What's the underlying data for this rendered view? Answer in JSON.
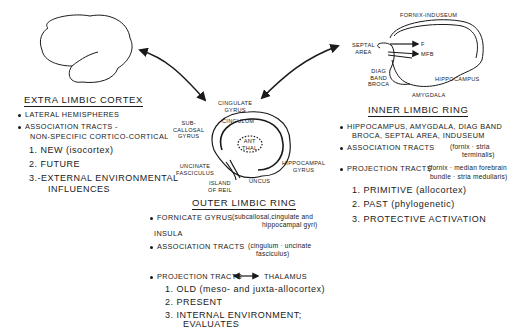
{
  "extra_limbic": {
    "heading": "EXTRA LIMBIC CORTEX",
    "bullets": [
      "LATERAL HEMISPHERES",
      "ASSOCIATION TRACTS -",
      "NON-SPECIFIC CORTICO-CORTICAL"
    ],
    "items": [
      "1. NEW (isocortex)",
      "2. FUTURE",
      "3.-EXTERNAL ENVIRONMENTAL",
      "INFLUENCES"
    ]
  },
  "center_labels": {
    "cingulate_gyrus": [
      "CINGULATE",
      "GYRUS"
    ],
    "subcallosal_gyrus": [
      "SUB-",
      "CALLOSAL",
      "GYRUS"
    ],
    "cingulum": "CINGULUM",
    "ant_thal": [
      "ANT",
      "THAL"
    ],
    "uncinate_fasciculus": [
      "UNCINATE",
      "FASCICULUS"
    ],
    "hippocampal_gyrus": [
      "HIPPOCAMPAL",
      "GYRUS"
    ],
    "island_of_reil": [
      "ISLAND",
      "OF REIL"
    ],
    "uncus": "UNCUS"
  },
  "outer_limbic": {
    "heading": "OUTER LIMBIC RING",
    "bullet1": "FORNICATE GYRUS",
    "bullet1_note": "(subcallosal,cingulate and",
    "bullet1_note2": "hippocampal gyri)",
    "insula": "INSULA",
    "bullet2": "ASSOCIATION TRACTS",
    "bullet2_note": "(cingulum · uncinate",
    "bullet2_note2": "fasciculus)",
    "bullet3": "PROJECTION TRACTS",
    "bullet3_target": "THALAMUS",
    "items": [
      "1. OLD (meso- and juxta-allocortex)",
      "2. PRESENT",
      "3. INTERNAL ENVIRONMENT;",
      "EVALUATES"
    ]
  },
  "inner_labels": {
    "fornix_induseum": "FORNIX-INDUSEUM",
    "septal_area": [
      "SEPTAL",
      "AREA"
    ],
    "f": "F",
    "mfb": "MFB",
    "diag_band_broca": [
      "DIAG",
      "BAND",
      "BROCA"
    ],
    "hippocampus": "HIPPOCAMPUS",
    "amygdala": "AMYGDALA"
  },
  "inner_limbic": {
    "heading": "INNER LIMBIC RING",
    "bullet1": "HIPPOCAMPUS, AMYGDALA, DIAG BAND",
    "bullet1b": "BROCA, SEPTAL AREA, INDUSEUM",
    "bullet2": "ASSOCIATION TRACTS",
    "bullet2_note": "(fornix · stria",
    "bullet2_note2": "terminalis)",
    "bullet3": "PROJECTION TRACTS",
    "bullet3_note": "(fornix · median forebrain",
    "bullet3_note2": "bundle · stria medullaris)",
    "items": [
      "1. PRIMITIVE (allocortex)",
      "2. PAST (phylogenetic)",
      "3. PROTECTIVE ACTIVATION"
    ]
  }
}
